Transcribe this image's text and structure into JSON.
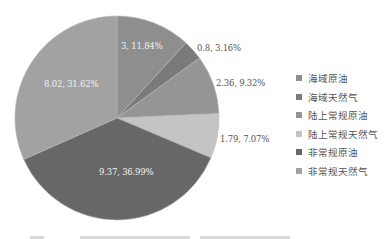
{
  "chart_data": {
    "type": "pie",
    "title": "",
    "start_angle_deg": 0,
    "direction": "clockwise",
    "categories": [
      "海域原油",
      "海域天然气",
      "陆上常规原油",
      "陆上常规天然气",
      "非常规原油",
      "非常规天然气"
    ],
    "values": [
      3,
      0.8,
      2.36,
      1.79,
      9.37,
      8.02
    ],
    "percentages": [
      11.84,
      3.16,
      9.32,
      7.07,
      36.99,
      31.62
    ],
    "data_labels": [
      "3, 11.84%",
      "0.8, 3.16%",
      "2.36, 9.32%",
      "1.79, 7.07%",
      "9.37, 36.99%",
      "8.02, 31.62%"
    ],
    "colors": [
      "#8e8e8e",
      "#7a7a7a",
      "#959595",
      "#c4c4c4",
      "#676767",
      "#a2a2a2"
    ],
    "legend_position": "right"
  },
  "labels": {
    "s0": "3, 11.84%",
    "s1": "0.8, 3.16%",
    "s2": "2.36, 9.32%",
    "s3": "1.79, 7.07%",
    "s4": "9.37, 36.99%",
    "s5": "8.02, 31.62%"
  },
  "legend": {
    "items": [
      {
        "label": "海域原油",
        "color": "#8e8e8e"
      },
      {
        "label": "海域天然气",
        "color": "#7a7a7a"
      },
      {
        "label": "陆上常规原油",
        "color": "#959595"
      },
      {
        "label": "陆上常规天然气",
        "color": "#c4c4c4"
      },
      {
        "label": "非常规原油",
        "color": "#676767"
      },
      {
        "label": "非常规天然气",
        "color": "#a2a2a2"
      }
    ]
  }
}
